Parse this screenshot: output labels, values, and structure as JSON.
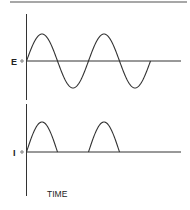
{
  "diagram": {
    "type": "waveform-comparison",
    "colors": {
      "stroke": "#333333",
      "top_rule": "#8a8a8a",
      "background": "#ffffff"
    },
    "top_trace": {
      "label": "E",
      "zero_marker": "o",
      "waveform": "sine",
      "cycles": 2
    },
    "bottom_trace": {
      "label": "I",
      "zero_marker": "o",
      "waveform": "half-wave-rectified-sine",
      "pulses": 2
    },
    "x_axis_label": "TIME"
  }
}
